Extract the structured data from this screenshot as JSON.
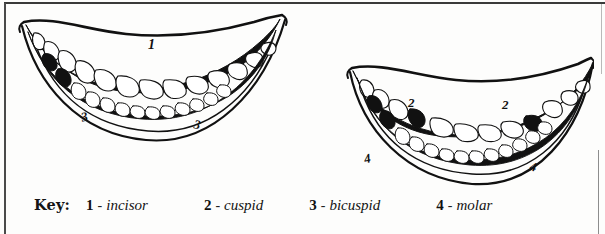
{
  "figure": {
    "caption_prefix": "Key:",
    "diagrams": [
      {
        "name": "upper-and-lower-teeth-front-view",
        "labels": [
          {
            "value": "1",
            "meaning": "incisor",
            "position": "upper-center"
          },
          {
            "value": "3",
            "meaning": "bicuspid",
            "position": "lower-left"
          },
          {
            "value": "3",
            "meaning": "bicuspid",
            "position": "lower-right"
          }
        ]
      },
      {
        "name": "upper-and-lower-teeth-front-view-2",
        "labels": [
          {
            "value": "2",
            "meaning": "cuspid",
            "position": "upper-left"
          },
          {
            "value": "2",
            "meaning": "cuspid",
            "position": "upper-right"
          },
          {
            "value": "4",
            "meaning": "molar",
            "position": "lower-left"
          },
          {
            "value": "4",
            "meaning": "molar",
            "position": "lower-right"
          }
        ]
      }
    ]
  },
  "key": {
    "title": "Key:",
    "entries": [
      {
        "number": "1",
        "dash": "-",
        "term": "incisor"
      },
      {
        "number": "2",
        "dash": "-",
        "term": "cuspid"
      },
      {
        "number": "3",
        "dash": "-",
        "term": "bicuspid"
      },
      {
        "number": "4",
        "dash": "-",
        "term": "molar"
      }
    ]
  },
  "labels_left": {
    "incisor": "1",
    "bicuspid_left": "3",
    "bicuspid_right": "3"
  },
  "labels_right": {
    "cuspid_left": "2",
    "cuspid_right": "2",
    "molar_left": "4",
    "molar_right": "4"
  },
  "colors": {
    "ink": "#111111",
    "paper": "#fdfdfc",
    "rule": "#3a3a3a"
  }
}
